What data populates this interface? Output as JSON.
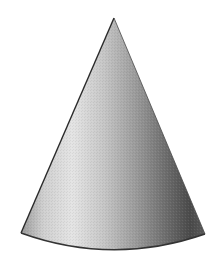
{
  "figure": {
    "subject": "cone",
    "shape": {
      "apex": [
        114,
        18
      ],
      "base_left": [
        21,
        233
      ],
      "base_right": [
        205,
        234
      ],
      "base_bottom_y": 252
    },
    "colors": {
      "background": "#ffffff",
      "highlight": "#e6e6e6",
      "mid": "#a8a8a8",
      "shadow": "#3c3c3c",
      "outline": "#2a2a2a"
    }
  }
}
